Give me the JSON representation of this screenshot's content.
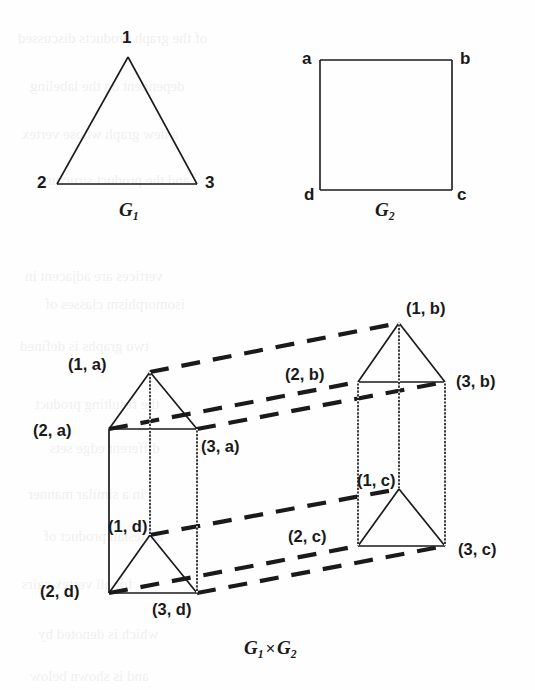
{
  "figure": {
    "background_color": "#fefefe",
    "ink_color": "#1a1a1a",
    "caption": {
      "g1": "G",
      "g1_sub": "1",
      "times": "×",
      "g2": "G",
      "g2_sub": "2"
    },
    "top_left_graph": {
      "name": "G1",
      "caption_base": "G",
      "caption_sub": "1",
      "shape": "triangle",
      "vertices": [
        {
          "label": "1",
          "x": 128,
          "y": 57
        },
        {
          "label": "2",
          "x": 57,
          "y": 184
        },
        {
          "label": "3",
          "x": 197,
          "y": 184
        }
      ],
      "edges": [
        [
          0,
          1
        ],
        [
          1,
          2
        ],
        [
          2,
          0
        ]
      ]
    },
    "top_right_graph": {
      "name": "G2",
      "caption_base": "G",
      "caption_sub": "2",
      "shape": "square",
      "vertices": [
        {
          "label": "a",
          "x": 320,
          "y": 60
        },
        {
          "label": "b",
          "x": 452,
          "y": 60
        },
        {
          "label": "c",
          "x": 452,
          "y": 190
        },
        {
          "label": "d",
          "x": 320,
          "y": 190
        }
      ],
      "edges": [
        [
          0,
          1
        ],
        [
          1,
          2
        ],
        [
          2,
          3
        ],
        [
          3,
          0
        ]
      ]
    },
    "product_graph": {
      "name": "G1 x G2",
      "vertices": [
        {
          "label": "(1, a)",
          "x": 150,
          "y": 372,
          "lx": 68,
          "ly": 356,
          "anchor": "right"
        },
        {
          "label": "(2, a)",
          "x": 109,
          "y": 429,
          "lx": 33,
          "ly": 422,
          "anchor": "right"
        },
        {
          "label": "(3, a)",
          "x": 197,
          "y": 429,
          "lx": 201,
          "ly": 438,
          "anchor": "left"
        },
        {
          "label": "(1, d)",
          "x": 150,
          "y": 535,
          "lx": 108,
          "ly": 518,
          "anchor": "left"
        },
        {
          "label": "(2, d)",
          "x": 109,
          "y": 593,
          "lx": 40,
          "ly": 583,
          "anchor": "right"
        },
        {
          "label": "(3, d)",
          "x": 197,
          "y": 593,
          "lx": 152,
          "ly": 601,
          "anchor": "left"
        },
        {
          "label": "(1, b)",
          "x": 399,
          "y": 323,
          "lx": 406,
          "ly": 300,
          "anchor": "left"
        },
        {
          "label": "(2, b)",
          "x": 358,
          "y": 382,
          "lx": 285,
          "ly": 366,
          "anchor": "right"
        },
        {
          "label": "(3, b)",
          "x": 445,
          "y": 382,
          "lx": 456,
          "ly": 373,
          "anchor": "left"
        },
        {
          "label": "(1, c)",
          "x": 399,
          "y": 489,
          "lx": 357,
          "ly": 472,
          "anchor": "left"
        },
        {
          "label": "(2, c)",
          "x": 358,
          "y": 546,
          "lx": 288,
          "ly": 528,
          "anchor": "right"
        },
        {
          "label": "(3, c)",
          "x": 445,
          "y": 546,
          "lx": 458,
          "ly": 541,
          "anchor": "left"
        }
      ],
      "solid_edges": [
        [
          0,
          1
        ],
        [
          1,
          2
        ],
        [
          2,
          0
        ],
        [
          3,
          4
        ],
        [
          4,
          5
        ],
        [
          5,
          3
        ],
        [
          6,
          7
        ],
        [
          7,
          8
        ],
        [
          8,
          6
        ],
        [
          9,
          10
        ],
        [
          10,
          11
        ],
        [
          11,
          9
        ],
        [
          0,
          3
        ],
        [
          1,
          4
        ],
        [
          2,
          5
        ],
        [
          6,
          9
        ],
        [
          7,
          10
        ],
        [
          8,
          11
        ]
      ],
      "dashed_edges": [
        [
          0,
          6
        ],
        [
          1,
          7
        ],
        [
          2,
          8
        ],
        [
          3,
          9
        ],
        [
          4,
          10
        ],
        [
          5,
          11
        ]
      ]
    }
  },
  "ghost_text": [
    {
      "t": "of the graph products discussed",
      "x": 18,
      "y": 30
    },
    {
      "t": "dependent on the labeling",
      "x": 30,
      "y": 78
    },
    {
      "t": "a new graph whose vertex",
      "x": 22,
      "y": 126
    },
    {
      "t": "and the product structure",
      "x": 40,
      "y": 172
    },
    {
      "t": "vertices are adjacent in",
      "x": 25,
      "y": 268
    },
    {
      "t": "isomorphism classes of",
      "x": 45,
      "y": 296
    },
    {
      "t": "two graphs is defined",
      "x": 20,
      "y": 338
    },
    {
      "t": "the resulting product",
      "x": 35,
      "y": 396
    },
    {
      "t": "different edge sets",
      "x": 50,
      "y": 440
    },
    {
      "t": "in a similar manner",
      "x": 28,
      "y": 486
    },
    {
      "t": "cartesian product of",
      "x": 44,
      "y": 528
    },
    {
      "t": "for all vertex pairs",
      "x": 22,
      "y": 576
    },
    {
      "t": "which is denoted by",
      "x": 38,
      "y": 626
    },
    {
      "t": "and is shown below",
      "x": 30,
      "y": 668
    }
  ]
}
